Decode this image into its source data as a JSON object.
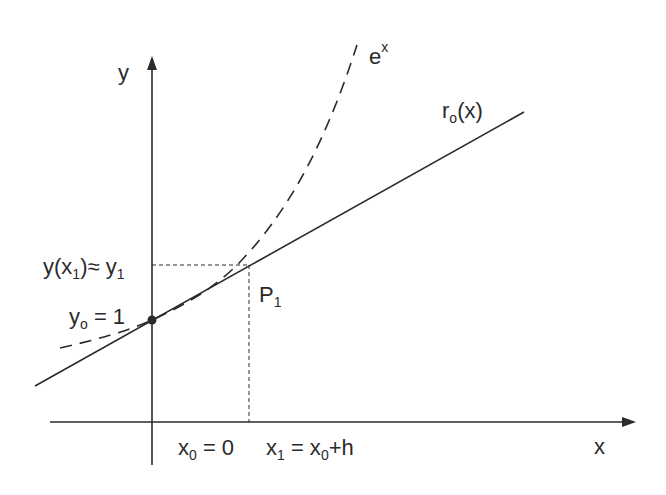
{
  "diagram": {
    "axes": {
      "x_label": "x",
      "y_label": "y"
    },
    "curves": [
      {
        "name": "exponential",
        "label_base": "e",
        "label_sup": "x",
        "style": "dashed"
      },
      {
        "name": "tangent",
        "label_base": "r",
        "label_sub": "o",
        "label_tail": "(x)",
        "style": "solid"
      }
    ],
    "labels": {
      "y1_approx": {
        "pre": "y(x",
        "sub1": "1",
        "mid": ")≈ y",
        "sub2": "1"
      },
      "y0": {
        "pre": "y",
        "sub": "o",
        "post": " = 1"
      },
      "p1": {
        "pre": "P",
        "sub": "1"
      },
      "x0": {
        "pre": "x",
        "sub": "0",
        "post": " = 0"
      },
      "x1": {
        "pre": "x",
        "sub": "1",
        "mid": " = x",
        "sub2": "0",
        "post": "+h"
      }
    },
    "points": [
      {
        "name": "initial-point",
        "x": 0,
        "y": 1
      },
      {
        "name": "P1",
        "x": "x0+h",
        "y": "y1"
      }
    ],
    "colors": {
      "ink": "#2a2a2a",
      "background": "#ffffff"
    }
  }
}
